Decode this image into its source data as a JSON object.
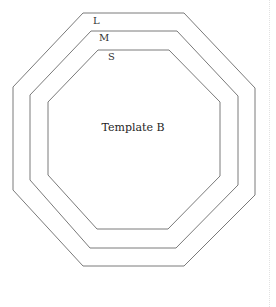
{
  "template": {
    "title": "Template B",
    "line_color": "#7a7a7a",
    "sizes": [
      {
        "label": "L",
        "label_pos": [
          93,
          16
        ],
        "points": [
          [
            83,
            13
          ],
          [
            184,
            13
          ],
          [
            255,
            88
          ],
          [
            255,
            195
          ],
          [
            184,
            266
          ],
          [
            83,
            266
          ],
          [
            13,
            190
          ],
          [
            13,
            87
          ]
        ]
      },
      {
        "label": "M",
        "label_pos": [
          99,
          33
        ],
        "points": [
          [
            91,
            31
          ],
          [
            177,
            31
          ],
          [
            238,
            96
          ],
          [
            238,
            185
          ],
          [
            176,
            248
          ],
          [
            90,
            248
          ],
          [
            30,
            180
          ],
          [
            30,
            95
          ]
        ]
      },
      {
        "label": "S",
        "label_pos": [
          108,
          52
        ],
        "points": [
          [
            98,
            50
          ],
          [
            169,
            50
          ],
          [
            220,
            102
          ],
          [
            220,
            176
          ],
          [
            168,
            229
          ],
          [
            97,
            229
          ],
          [
            48,
            175
          ],
          [
            48,
            102
          ]
        ]
      }
    ],
    "title_pos": [
      133,
      122
    ]
  }
}
